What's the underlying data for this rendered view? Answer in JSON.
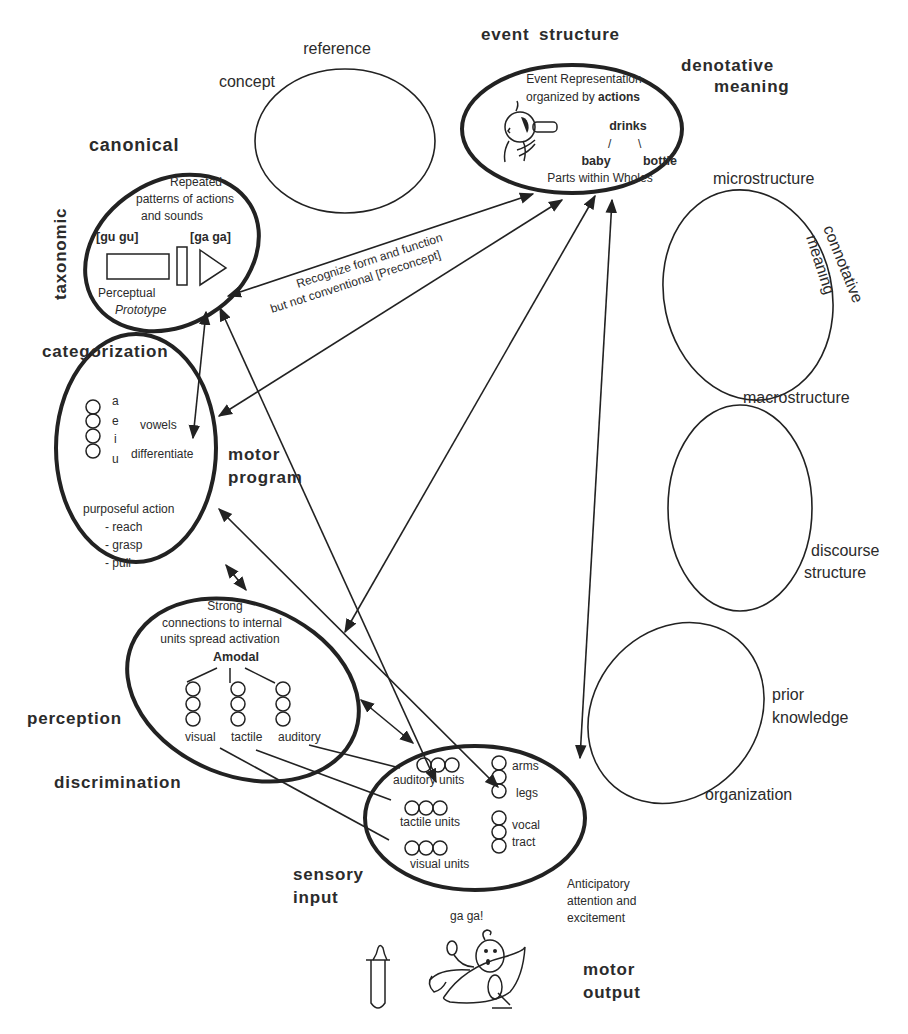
{
  "diagram": {
    "type": "concept-network",
    "colors": {
      "ink": "#222222",
      "background": "#ffffff"
    },
    "outer_labels": {
      "reference": "reference",
      "concept": "concept",
      "event_structure": "event  structure",
      "denotative_1": "denotative",
      "denotative_2": "meaning",
      "canonical": "canonical",
      "taxonomic": "taxonomic",
      "microstructure": "microstructure",
      "connotative_1": "connotative",
      "connotative_2": "meaning",
      "categorization": "categorization",
      "motor_program_1": "motor",
      "motor_program_2": "program",
      "macrostructure": "macrostructure",
      "discourse_1": "discourse",
      "discourse_2": "structure",
      "prior_1": "prior",
      "prior_2": "knowledge",
      "perception": "perception",
      "discrimination": "discrimination",
      "organization": "organization",
      "sensory_1": "sensory",
      "sensory_2": "input",
      "motor_output_1": "motor",
      "motor_output_2": "output",
      "anticipatory_1": "Anticipatory",
      "anticipatory_2": "attention and",
      "anticipatory_3": "excitement",
      "ga_ga": "ga  ga!"
    },
    "event_node": {
      "line1": "Event Representation",
      "line2_a": "organized by ",
      "line2_b": "actions",
      "verb": "drinks",
      "slash_left": "/",
      "slash_right": "\\",
      "agent": "baby",
      "object": "bottle",
      "footer": "Parts within Wholes"
    },
    "canonical_node": {
      "line1": "Repeated",
      "line2": "patterns of actions",
      "line3": "and sounds",
      "sound_left": "[gu  gu]",
      "sound_right": "[ga  ga]",
      "caption1": "Perceptual",
      "caption2": "Prototype"
    },
    "link_label": {
      "line1": "Recognize form and function",
      "line2": "but not conventional  [Preconcept]"
    },
    "motor_program_node": {
      "vowels": [
        "a",
        "e",
        "i",
        "u"
      ],
      "vowels_label": "vowels",
      "differentiate_label": "differentiate",
      "action_title": "purposeful action",
      "actions": [
        "- reach",
        "- grasp",
        "- pull"
      ]
    },
    "perception_node": {
      "line1": "Strong",
      "line2": "connections to internal",
      "line3": "units spread activation",
      "hub": "Amodal",
      "modalities": [
        "visual",
        "tactile",
        "auditory"
      ]
    },
    "sensory_node": {
      "units": [
        "auditory units",
        "tactile units",
        "visual units"
      ],
      "body_1": "arms",
      "body_2": "legs",
      "body_3": "vocal",
      "body_4": "tract"
    }
  }
}
